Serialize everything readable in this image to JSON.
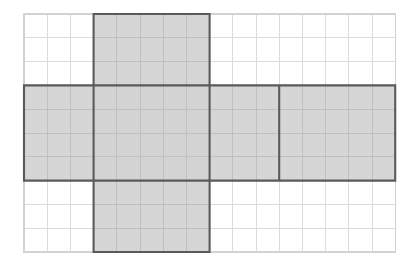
{
  "figure": {
    "kind": "cube-net-on-grid",
    "background_color": "#ffffff"
  },
  "grid": {
    "columns": 16,
    "rows": 10,
    "origin_x": 24,
    "origin_y": 14,
    "cell_width": 23.2,
    "cell_height": 23.8,
    "line_color": "#dcdcdc",
    "border_color": "#d2d2d2",
    "line_width": 1
  },
  "net": {
    "fill_color": "#d2d2d2",
    "outline_color": "#5a5a5a",
    "outline_width": 2.1,
    "inner_line_color": "#c0c0c0",
    "shape": "cross",
    "vertical_arm": {
      "col_start": 3,
      "col_end": 8,
      "row_start": 0,
      "row_end": 10,
      "width_cells": 5,
      "height_cells": 10
    },
    "horizontal_band": {
      "col_start": 0,
      "col_end": 16,
      "row_start": 3,
      "row_end": 7,
      "width_cells": 16,
      "height_cells": 4
    },
    "outline_path_cells": [
      [
        3,
        0
      ],
      [
        8,
        0
      ],
      [
        8,
        3
      ],
      [
        16,
        3
      ],
      [
        16,
        7
      ],
      [
        8,
        7
      ],
      [
        8,
        10
      ],
      [
        3,
        10
      ],
      [
        3,
        7
      ],
      [
        0,
        7
      ],
      [
        0,
        3
      ],
      [
        3,
        3
      ]
    ],
    "interior_dividers": [
      {
        "type": "vertical",
        "col": 3,
        "row_start": 3,
        "row_end": 7
      },
      {
        "type": "vertical",
        "col": 8,
        "row_start": 3,
        "row_end": 7
      },
      {
        "type": "vertical",
        "col": 11,
        "row_start": 3,
        "row_end": 7
      },
      {
        "type": "horizontal",
        "row": 3,
        "col_start": 3,
        "col_end": 8
      },
      {
        "type": "horizontal",
        "row": 7,
        "col_start": 3,
        "col_end": 8
      }
    ],
    "faces": [
      {
        "name": "top-face",
        "col_start": 3,
        "col_end": 8,
        "row_start": 0,
        "row_end": 3
      },
      {
        "name": "left-face",
        "col_start": 0,
        "col_end": 3,
        "row_start": 3,
        "row_end": 7
      },
      {
        "name": "front-face",
        "col_start": 3,
        "col_end": 8,
        "row_start": 3,
        "row_end": 7
      },
      {
        "name": "right-face",
        "col_start": 8,
        "col_end": 11,
        "row_start": 3,
        "row_end": 7
      },
      {
        "name": "back-face",
        "col_start": 11,
        "col_end": 16,
        "row_start": 3,
        "row_end": 7
      },
      {
        "name": "bottom-face",
        "col_start": 3,
        "col_end": 8,
        "row_start": 7,
        "row_end": 10
      }
    ]
  }
}
